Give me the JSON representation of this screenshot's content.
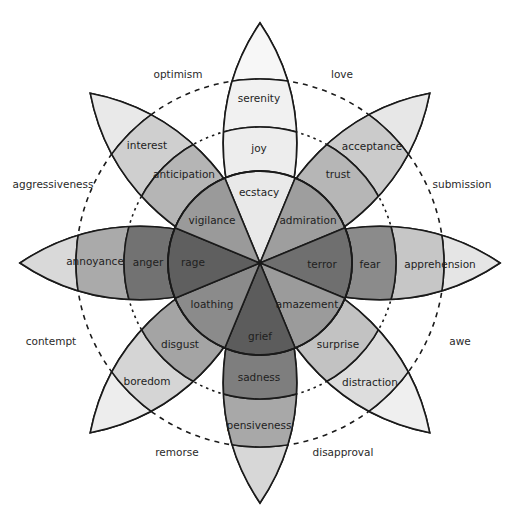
{
  "geometry": {
    "cx": 260,
    "cy": 263,
    "r_core": 92,
    "r_mid": 136,
    "r_outer": 184,
    "r_tip": 240
  },
  "petals": [
    {
      "id": "joy",
      "angle": 0,
      "core": "ecstacy",
      "mid": "joy",
      "outer": "serenity",
      "colors": [
        "#e9e9e9",
        "#ededed",
        "#f1f1f1",
        "#f7f7f7"
      ]
    },
    {
      "id": "trust",
      "angle": 45,
      "core": "admiration",
      "mid": "trust",
      "outer": "acceptance",
      "colors": [
        "#9e9e9e",
        "#b6b6b6",
        "#cbcbcb",
        "#e7e7e7"
      ]
    },
    {
      "id": "fear",
      "angle": 90,
      "core": "terror",
      "mid": "fear",
      "outer": "apprehension",
      "colors": [
        "#6f6f6f",
        "#8b8b8b",
        "#c6c6c6",
        "#e5e5e5"
      ]
    },
    {
      "id": "surprise",
      "angle": 135,
      "core": "amazement",
      "mid": "surprise",
      "outer": "distraction",
      "colors": [
        "#9b9b9b",
        "#c2c2c2",
        "#dddddd",
        "#efefef"
      ]
    },
    {
      "id": "sadness",
      "angle": 180,
      "core": "grief",
      "mid": "sadness",
      "outer": "pensiveness",
      "colors": [
        "#5c5c5c",
        "#7e7e7e",
        "#a8a8a8",
        "#d7d7d7"
      ]
    },
    {
      "id": "disgust",
      "angle": 225,
      "core": "loathing",
      "mid": "disgust",
      "outer": "boredom",
      "colors": [
        "#8b8b8b",
        "#a4a4a4",
        "#d5d5d5",
        "#ededed"
      ]
    },
    {
      "id": "anger",
      "angle": 270,
      "core": "rage",
      "mid": "anger",
      "outer": "annoyance",
      "colors": [
        "#5f5f5f",
        "#727272",
        "#aaaaaa",
        "#d9d9d9"
      ]
    },
    {
      "id": "anticipation",
      "angle": 315,
      "core": "vigilance",
      "mid": "anticipation",
      "outer": "interest",
      "colors": [
        "#9a9a9a",
        "#b5b5b5",
        "#cfcfcf",
        "#e9e9e9"
      ]
    }
  ],
  "dyads": [
    {
      "label": "love",
      "x": 342,
      "y": 75
    },
    {
      "label": "submission",
      "x": 462,
      "y": 185
    },
    {
      "label": "awe",
      "x": 460,
      "y": 342
    },
    {
      "label": "disapproval",
      "x": 343,
      "y": 453
    },
    {
      "label": "remorse",
      "x": 177,
      "y": 453
    },
    {
      "label": "contempt",
      "x": 51,
      "y": 342
    },
    {
      "label": "aggressiveness",
      "x": 53,
      "y": 185
    },
    {
      "label": "optimism",
      "x": 178,
      "y": 75
    }
  ],
  "labels": {
    "ecstacy": {
      "x": 259,
      "y": 193
    },
    "joy": {
      "x": 259,
      "y": 149
    },
    "serenity": {
      "x": 259,
      "y": 99
    },
    "admiration": {
      "x": 308,
      "y": 221
    },
    "trust": {
      "x": 338,
      "y": 175
    },
    "acceptance": {
      "x": 372,
      "y": 147
    },
    "terror": {
      "x": 322,
      "y": 265
    },
    "fear": {
      "x": 370,
      "y": 265
    },
    "apprehension": {
      "x": 440,
      "y": 265
    },
    "amazement": {
      "x": 307,
      "y": 305
    },
    "surprise": {
      "x": 338,
      "y": 345
    },
    "distraction": {
      "x": 370,
      "y": 383
    },
    "grief": {
      "x": 260,
      "y": 337
    },
    "sadness": {
      "x": 259,
      "y": 378
    },
    "pensiveness": {
      "x": 259,
      "y": 426
    },
    "loathing": {
      "x": 212,
      "y": 305
    },
    "disgust": {
      "x": 180,
      "y": 345
    },
    "boredom": {
      "x": 147,
      "y": 382
    },
    "rage": {
      "x": 193,
      "y": 263
    },
    "anger": {
      "x": 148,
      "y": 263
    },
    "annoyance": {
      "x": 95,
      "y": 262
    },
    "vigilance": {
      "x": 212,
      "y": 221
    },
    "anticipation": {
      "x": 184,
      "y": 175
    },
    "interest": {
      "x": 147,
      "y": 146
    }
  }
}
